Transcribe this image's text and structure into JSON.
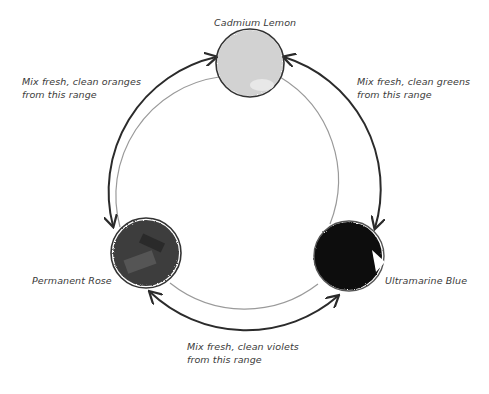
{
  "diagram": {
    "paints": [
      {
        "name": "Cadmium Lemon",
        "color": "#d2d2d2"
      },
      {
        "name": "Permanent Rose",
        "color": "#3e3e3e"
      },
      {
        "name": "Ultramarine Blue",
        "color": "#0a0a0a"
      }
    ],
    "ranges": [
      {
        "line1": "Mix fresh, clean oranges",
        "line2": "from this range"
      },
      {
        "line1": "Mix fresh, clean greens",
        "line2": "from this range"
      },
      {
        "line1": "Mix fresh, clean violets",
        "line2": "from this range"
      }
    ],
    "colors": {
      "outer_arc": "#2b2b2b",
      "inner_arc": "#9a9a9a",
      "text": "#3a3a3a"
    }
  }
}
